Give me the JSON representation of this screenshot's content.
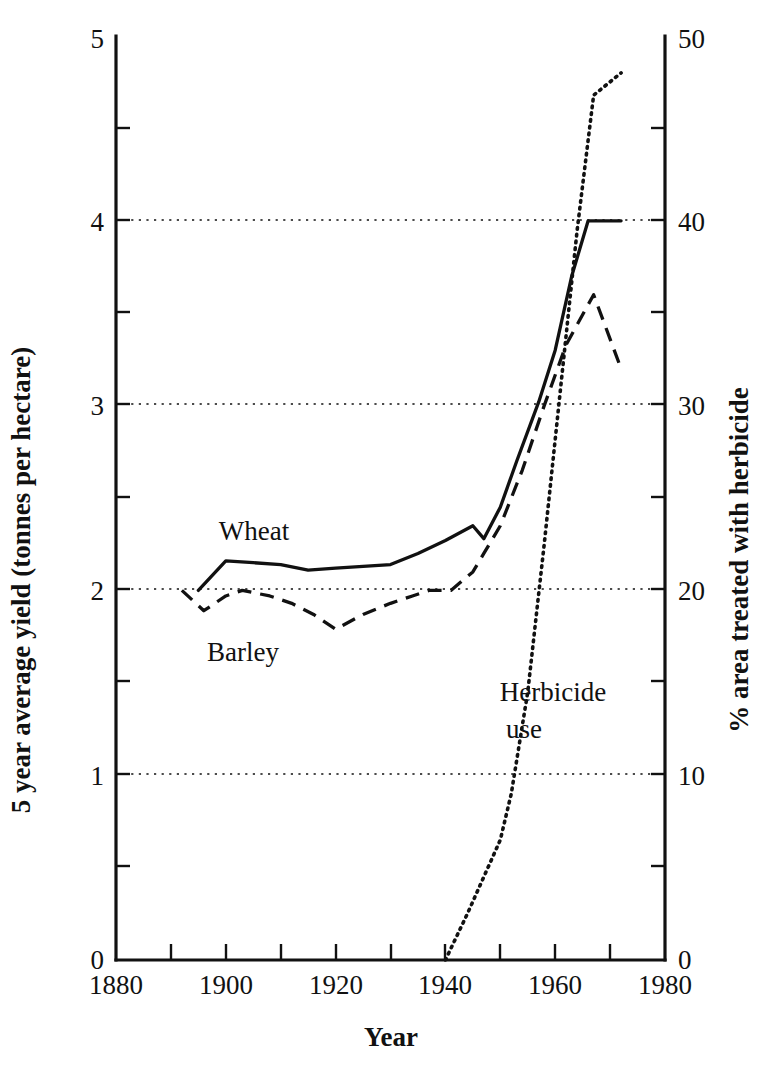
{
  "chart_data": {
    "type": "line",
    "title": "",
    "xlabel": "Year",
    "ylabel": "5 year average yield (tonnes per hectare)",
    "y2label": "% area treated with herbicide",
    "xlim": [
      1880,
      1980
    ],
    "ylim": [
      0,
      5
    ],
    "y2lim": [
      0,
      50
    ],
    "xticks": [
      1880,
      1890,
      1900,
      1910,
      1920,
      1930,
      1940,
      1950,
      1960,
      1970,
      1980
    ],
    "xticklabels": [
      "1880",
      "",
      "1900",
      "",
      "1920",
      "",
      "1940",
      "",
      "1960",
      "",
      "1980"
    ],
    "yticks": [
      0,
      0.5,
      1,
      1.5,
      2,
      2.5,
      3,
      3.5,
      4,
      4.5,
      5
    ],
    "yticklabels": [
      "0",
      "",
      "1",
      "",
      "2",
      "",
      "3",
      "",
      "4",
      "",
      "5"
    ],
    "y2ticks": [
      0,
      5,
      10,
      15,
      20,
      25,
      30,
      35,
      40,
      45,
      50
    ],
    "y2ticklabels": [
      "0",
      "",
      "10",
      "",
      "20",
      "",
      "30",
      "",
      "40",
      "",
      "50"
    ],
    "gridlines_y": [
      1,
      2,
      3,
      4
    ],
    "grid": true,
    "legend_position": "inline-annotations",
    "series": [
      {
        "name": "Wheat",
        "style": "solid",
        "axis": "left",
        "label_x": 1925,
        "label_y": 2.52,
        "x": [
          1895,
          1900,
          1905,
          1910,
          1915,
          1920,
          1925,
          1930,
          1935,
          1940,
          1945,
          1947,
          1950,
          1953,
          1957,
          1960,
          1963,
          1966,
          1972
        ],
        "y": [
          2.0,
          2.16,
          2.15,
          2.14,
          2.11,
          2.12,
          2.13,
          2.14,
          2.2,
          2.27,
          2.35,
          2.28,
          2.45,
          2.7,
          3.02,
          3.3,
          3.7,
          4.0,
          4.0
        ]
      },
      {
        "name": "Barley",
        "style": "dashed",
        "axis": "left",
        "label_x": 1921,
        "label_y": 1.57,
        "x": [
          1892,
          1896,
          1900,
          1903,
          1908,
          1912,
          1916,
          1920,
          1925,
          1930,
          1934,
          1937,
          1941,
          1945,
          1947,
          1950,
          1954,
          1958,
          1962,
          1967,
          1972
        ],
        "y": [
          2.0,
          1.89,
          1.97,
          2.0,
          1.97,
          1.93,
          1.87,
          1.79,
          1.87,
          1.93,
          1.97,
          2.0,
          2.0,
          2.1,
          2.2,
          2.35,
          2.65,
          3.0,
          3.33,
          3.6,
          3.2
        ]
      },
      {
        "name": "Herbicide use",
        "style": "dotted",
        "axis": "right",
        "label_x": 1950,
        "label_y": 14.0,
        "label_line1": "Herbicide",
        "label_line2": "use",
        "x": [
          1940,
          1944,
          1947,
          1950,
          1952,
          1955,
          1958,
          1961,
          1964,
          1967,
          1972
        ],
        "y": [
          0.0,
          2.5,
          4.5,
          6.5,
          9.0,
          14.5,
          22.5,
          31.0,
          39.5,
          46.8,
          48.0
        ]
      }
    ],
    "colors": {
      "line": "#111111",
      "grid": "#111111",
      "axis": "#111111",
      "background": "#ffffff"
    }
  }
}
